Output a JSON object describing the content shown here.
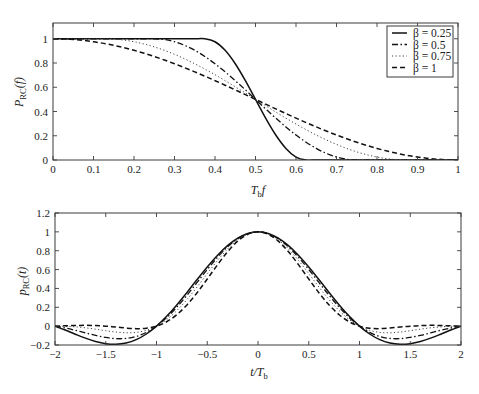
{
  "chart_data": [
    {
      "type": "line",
      "title": "",
      "xlabel": "T_b f",
      "xlabel_parts": [
        "T",
        "b",
        "f"
      ],
      "ylabel": "P_RC(f)",
      "ylabel_parts": [
        "P",
        "RC",
        "(f)"
      ],
      "xlim": [
        0,
        1
      ],
      "ylim": [
        0,
        1.13
      ],
      "grid": false,
      "xticks": [
        0,
        0.1,
        0.2,
        0.3,
        0.4,
        0.5,
        0.6,
        0.7,
        0.8,
        0.9,
        1
      ],
      "xtick_labels": [
        "0",
        "0.1",
        "0.2",
        "0.3",
        "0.4",
        "0.5",
        "0.6",
        "0.7",
        "0.8",
        "0.9",
        "1"
      ],
      "yticks": [
        0,
        0.2,
        0.4,
        0.6,
        0.8,
        1
      ],
      "ytick_labels": [
        "0",
        "0.2",
        "0.4",
        "0.6",
        "0.8",
        "1"
      ],
      "legend": {
        "position": "upper right",
        "entries": [
          "β = 0.25",
          "β = 0.5",
          "β = 0.75",
          "β = 1"
        ]
      },
      "x": [
        0,
        0.025,
        0.05,
        0.075,
        0.1,
        0.125,
        0.15,
        0.175,
        0.2,
        0.225,
        0.25,
        0.275,
        0.3,
        0.325,
        0.35,
        0.375,
        0.4,
        0.425,
        0.45,
        0.475,
        0.5,
        0.525,
        0.55,
        0.575,
        0.6,
        0.625,
        0.65,
        0.675,
        0.7,
        0.725,
        0.75,
        0.775,
        0.8,
        0.825,
        0.85,
        0.875,
        0.9,
        0.925,
        0.95,
        0.975,
        1
      ],
      "series": [
        {
          "name": "β = 0.25",
          "style": "solid",
          "values": [
            1,
            1,
            1,
            1,
            1,
            1,
            1,
            1,
            1,
            1,
            1,
            1,
            1,
            1,
            1,
            1,
            0.9755,
            0.9045,
            0.7939,
            0.6545,
            0.5,
            0.3455,
            0.2061,
            0.0955,
            0.0245,
            0,
            0,
            0,
            0,
            0,
            0,
            0,
            0,
            0,
            0,
            0,
            0,
            0,
            0,
            0,
            0
          ]
        },
        {
          "name": "β = 0.5",
          "style": "dashdot",
          "values": [
            1,
            1,
            1,
            1,
            1,
            1,
            1,
            1,
            1,
            1,
            1,
            0.9938,
            0.9755,
            0.9455,
            0.9045,
            0.8536,
            0.7939,
            0.727,
            0.6545,
            0.5782,
            0.5,
            0.4218,
            0.3455,
            0.273,
            0.2061,
            0.1464,
            0.0955,
            0.0545,
            0.0245,
            0.0062,
            0,
            0,
            0,
            0,
            0,
            0,
            0,
            0,
            0,
            0,
            0
          ]
        },
        {
          "name": "β = 0.75",
          "style": "dotted",
          "values": [
            1,
            1,
            1,
            1,
            1,
            1,
            0.9973,
            0.9891,
            0.9755,
            0.9568,
            0.933,
            0.9045,
            0.8716,
            0.8346,
            0.7939,
            0.75,
            0.7034,
            0.6545,
            0.604,
            0.5523,
            0.5,
            0.4477,
            0.396,
            0.3455,
            0.2966,
            0.25,
            0.2061,
            0.1654,
            0.1284,
            0.0955,
            0.067,
            0.0432,
            0.0245,
            0.0109,
            0.0027,
            0,
            0,
            0,
            0,
            0,
            0
          ]
        },
        {
          "name": "β = 1",
          "style": "dashed",
          "values": [
            1,
            0.9985,
            0.9938,
            0.9862,
            0.9755,
            0.9619,
            0.9455,
            0.9263,
            0.9045,
            0.8802,
            0.8536,
            0.8247,
            0.7939,
            0.7612,
            0.727,
            0.6913,
            0.6545,
            0.6167,
            0.5782,
            0.5392,
            0.5,
            0.4608,
            0.4218,
            0.3833,
            0.3455,
            0.3087,
            0.273,
            0.2388,
            0.2061,
            0.1753,
            0.1464,
            0.1198,
            0.0955,
            0.0737,
            0.0545,
            0.0381,
            0.0245,
            0.0138,
            0.0062,
            0.0015,
            0
          ]
        }
      ]
    },
    {
      "type": "line",
      "title": "",
      "xlabel": "t/T_b",
      "xlabel_parts": [
        "t/T",
        "b"
      ],
      "ylabel": "p_RC(t)",
      "ylabel_parts": [
        "p",
        "RC",
        "(t)"
      ],
      "xlim": [
        -2,
        2
      ],
      "ylim": [
        -0.2,
        1.2
      ],
      "grid": false,
      "xticks": [
        -2,
        -1.5,
        -1,
        -0.5,
        0,
        0.5,
        1,
        1.5,
        2
      ],
      "xtick_labels": [
        "−2",
        "−1.5",
        "−1",
        "−0.5",
        "0",
        "0.5",
        "1",
        "1.5",
        "2"
      ],
      "yticks": [
        -0.2,
        0,
        0.2,
        0.4,
        0.6,
        0.8,
        1,
        1.2
      ],
      "ytick_labels": [
        "−0.2",
        "0",
        "0.2",
        "0.4",
        "0.6",
        "0.8",
        "1",
        "1.2"
      ],
      "x": [
        -2,
        -1.9,
        -1.8,
        -1.7,
        -1.6,
        -1.5,
        -1.4,
        -1.3,
        -1.2,
        -1.1,
        -1,
        -0.9,
        -0.8,
        -0.7,
        -0.6,
        -0.5,
        -0.4,
        -0.3,
        -0.2,
        -0.1,
        0,
        0.1,
        0.2,
        0.3,
        0.4,
        0.5,
        0.6,
        0.7,
        0.8,
        0.9,
        1,
        1.1,
        1.2,
        1.3,
        1.4,
        1.5,
        1.6,
        1.7,
        1.8,
        1.9,
        2
      ],
      "series": [
        {
          "name": "β = 0.25",
          "style": "solid",
          "values": [
            0,
            -0.0417,
            -0.0856,
            -0.1274,
            -0.1624,
            -0.1856,
            -0.1925,
            -0.1792,
            -0.1432,
            -0.0833,
            0,
            0.1042,
            0.2252,
            0.3575,
            0.494,
            0.6274,
            0.7498,
            0.8539,
            0.9333,
            0.9831,
            1,
            0.9831,
            0.9333,
            0.8539,
            0.7498,
            0.6274,
            0.494,
            0.3575,
            0.2252,
            0.1042,
            0,
            -0.0833,
            -0.1432,
            -0.1792,
            -0.1925,
            -0.1856,
            -0.1624,
            -0.1274,
            -0.0856,
            -0.0417,
            0
          ]
        },
        {
          "name": "β = 0.5",
          "style": "dashdot",
          "values": [
            0,
            -0.0196,
            -0.0441,
            -0.0714,
            -0.0981,
            -0.12,
            -0.1324,
            -0.1303,
            -0.1095,
            -0.0666,
            0,
            0.09,
            0.2008,
            0.3275,
            0.4634,
            0.6002,
            0.7289,
            0.8405,
            0.9268,
            0.9813,
            1,
            0.9813,
            0.9268,
            0.8405,
            0.7289,
            0.6002,
            0.4634,
            0.3275,
            0.2008,
            0.09,
            0,
            -0.0666,
            -0.1095,
            -0.1303,
            -0.1324,
            -0.12,
            -0.0981,
            -0.0714,
            -0.0441,
            -0.0196,
            0
          ]
        },
        {
          "name": "β = 0.75",
          "style": "dotted",
          "values": [
            0,
            -0.0017,
            -0.0075,
            -0.0179,
            -0.0322,
            -0.0483,
            -0.0626,
            -0.0705,
            -0.0662,
            -0.0443,
            0,
            0.0694,
            0.1643,
            0.2816,
            0.4154,
            0.5569,
            0.6951,
            0.8185,
            0.916,
            0.9785,
            1,
            0.9785,
            0.916,
            0.8185,
            0.6951,
            0.5569,
            0.4154,
            0.2816,
            0.1643,
            0.0694,
            0,
            -0.0443,
            -0.0662,
            -0.0705,
            -0.0626,
            -0.0483,
            -0.0322,
            -0.0179,
            -0.0075,
            -0.0017,
            0
          ]
        },
        {
          "name": "β = 1",
          "style": "dashed",
          "values": [
            0,
            0.0037,
            0.007,
            0.0084,
            0.0063,
            0,
            -0.0098,
            -0.0202,
            -0.0265,
            -0.0222,
            0,
            0.0464,
            0.1213,
            0.2253,
            0.3544,
            0.5,
            0.6497,
            0.7884,
            0.901,
            0.9745,
            1,
            0.9745,
            0.901,
            0.7884,
            0.6497,
            0.5,
            0.3544,
            0.2253,
            0.1213,
            0.0464,
            0,
            -0.0222,
            -0.0265,
            -0.0202,
            -0.0098,
            0,
            0.0063,
            0.0084,
            0.007,
            0.0037,
            0
          ]
        }
      ]
    }
  ]
}
